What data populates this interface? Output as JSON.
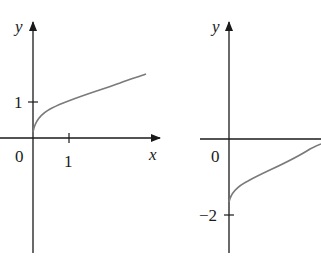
{
  "colors": {
    "axis": "#1a1a1a",
    "curve": "#7a7a7a",
    "background": "#ffffff"
  },
  "graphs": [
    {
      "name": "left-graph",
      "axis_labels": {
        "x": "x",
        "y": "y"
      },
      "origin_label": "0",
      "x_tick_label": "1",
      "y_tick_label": "1",
      "curve": "square-root curve starting near origin, increasing"
    },
    {
      "name": "right-graph",
      "axis_labels": {
        "y": "y"
      },
      "origin_label": "0",
      "y_tick_label": "−2",
      "curve": "square-root curve starting at (0,−2), increasing"
    }
  ]
}
